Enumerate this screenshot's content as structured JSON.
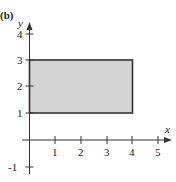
{
  "figure": {
    "part_label": "(b)",
    "x_axis": {
      "label": "x",
      "ticks": [
        "1",
        "2",
        "3",
        "4",
        "5"
      ]
    },
    "y_axis": {
      "label": "y",
      "ticks": [
        "-1",
        "1",
        "2",
        "3",
        "4"
      ]
    },
    "region": {
      "x_range": [
        0,
        4
      ],
      "y_range": [
        1,
        3
      ],
      "fill": "#d4d4d4",
      "stroke": "#333333"
    }
  }
}
